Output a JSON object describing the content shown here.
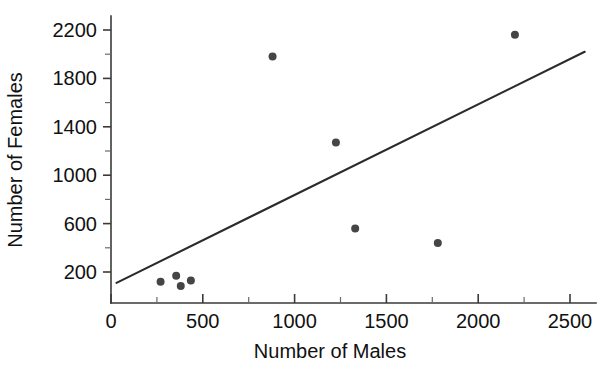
{
  "chart_data": {
    "type": "scatter",
    "title": "",
    "xlabel": "Number of Males",
    "ylabel": "Number of Females",
    "xlim": [
      0,
      2600
    ],
    "ylim": [
      45,
      2300
    ],
    "grid": false,
    "legend": "none",
    "x_ticks": [
      0,
      500,
      1000,
      1500,
      2000,
      2500
    ],
    "x_tick_labels": [
      "0",
      "500",
      "1000",
      "1500",
      "2000",
      "2500"
    ],
    "x_minor_step": 250,
    "y_ticks": [
      200,
      600,
      1000,
      1400,
      1800,
      2200
    ],
    "y_tick_labels": [
      "200",
      "600",
      "1000",
      "1400",
      "1800",
      "2200"
    ],
    "y_minor_step": 200,
    "points": [
      {
        "x": 270,
        "y": 120
      },
      {
        "x": 355,
        "y": 170
      },
      {
        "x": 380,
        "y": 85
      },
      {
        "x": 435,
        "y": 130
      },
      {
        "x": 880,
        "y": 1980
      },
      {
        "x": 1225,
        "y": 1270
      },
      {
        "x": 1330,
        "y": 560
      },
      {
        "x": 1780,
        "y": 440
      },
      {
        "x": 2200,
        "y": 2160
      }
    ],
    "point_marker": "filled-circle",
    "point_radius": 4,
    "point_color": "#454545",
    "trend_line": {
      "type": "linear-fit",
      "x_start": 30,
      "y_start": 110,
      "x_end": 2580,
      "y_end": 2020,
      "color": "#2b2b2b"
    },
    "axis_color": "#3a3a3a"
  },
  "axes": {
    "x_title": "Number of Males",
    "y_title": "Number of Females"
  }
}
